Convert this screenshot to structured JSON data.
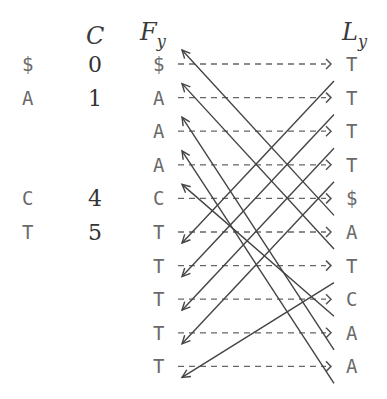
{
  "headers": {
    "c_label": "C",
    "f_label": "F",
    "f_sub": "y",
    "l_label": "L",
    "l_sub": "y"
  },
  "c_table": [
    {
      "symbol": "$",
      "value": "0",
      "row": 0
    },
    {
      "symbol": "A",
      "value": "1",
      "row": 1
    },
    {
      "symbol": "C",
      "value": "4",
      "row": 4
    },
    {
      "symbol": "T",
      "value": "5",
      "row": 5
    }
  ],
  "f_column": [
    "$",
    "A",
    "A",
    "A",
    "C",
    "T",
    "T",
    "T",
    "T",
    "T"
  ],
  "l_column": [
    "T",
    "T",
    "T",
    "T",
    "$",
    "A",
    "T",
    "C",
    "A",
    "A"
  ],
  "lf_mapping": [
    {
      "from_l_row": 0,
      "to_f_row": 5
    },
    {
      "from_l_row": 1,
      "to_f_row": 6
    },
    {
      "from_l_row": 2,
      "to_f_row": 7
    },
    {
      "from_l_row": 3,
      "to_f_row": 8
    },
    {
      "from_l_row": 4,
      "to_f_row": 0
    },
    {
      "from_l_row": 5,
      "to_f_row": 1
    },
    {
      "from_l_row": 6,
      "to_f_row": 9
    },
    {
      "from_l_row": 7,
      "to_f_row": 4
    },
    {
      "from_l_row": 8,
      "to_f_row": 2
    },
    {
      "from_l_row": 9,
      "to_f_row": 3
    }
  ],
  "colors": {
    "text_mono": "#6a6a6a",
    "text_serif": "#333333",
    "lines": "#444444"
  }
}
